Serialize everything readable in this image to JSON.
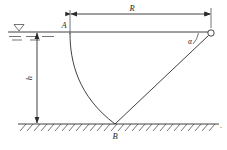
{
  "figure": {
    "title_present": false,
    "background_color": "#ffffff",
    "line_color": "#2b2b2b",
    "labels": {
      "point_a": "A",
      "point_b": "B",
      "range": "R",
      "depth": "h",
      "angle": "α",
      "trailing_period": "."
    },
    "geometry": {
      "water_surface_y": 32,
      "ground_y": 124,
      "point_a_x": 70,
      "point_a_y": 32,
      "point_b_x": 115,
      "point_b_y": 124,
      "nozzle_x": 211,
      "nozzle_y": 33,
      "nozzle_radius": 3.2,
      "dimension_r_y": 14,
      "dimension_h_x": 37
    },
    "elements": [
      {
        "name": "water-surface-line",
        "type": "line",
        "description": "horizontal free surface"
      },
      {
        "name": "water-level-symbol",
        "type": "marker",
        "description": "inverted triangle with dashes"
      },
      {
        "name": "ground-line",
        "type": "line",
        "description": "hatched ground surface"
      },
      {
        "name": "jet-trajectory-curve",
        "type": "curve",
        "description": "curved path from A to B"
      },
      {
        "name": "jet-ray-line",
        "type": "line",
        "description": "straight ray from B to nozzle"
      },
      {
        "name": "range-dimension",
        "type": "dimension",
        "description": "horizontal distance R"
      },
      {
        "name": "depth-dimension",
        "type": "dimension",
        "description": "vertical depth h"
      },
      {
        "name": "angle-arc",
        "type": "arc",
        "description": "angle alpha at nozzle"
      }
    ]
  }
}
